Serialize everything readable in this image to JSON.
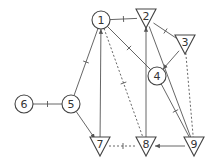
{
  "diagram": {
    "nodes": [
      {
        "id": "1",
        "label": "1",
        "shape": "circle",
        "x": 101,
        "y": 20
      },
      {
        "id": "2",
        "label": "2",
        "shape": "triangle",
        "x": 146,
        "y": 18
      },
      {
        "id": "3",
        "label": "3",
        "shape": "triangle",
        "x": 185,
        "y": 44
      },
      {
        "id": "4",
        "label": "4",
        "shape": "circle",
        "x": 157,
        "y": 76
      },
      {
        "id": "5",
        "label": "5",
        "shape": "circle",
        "x": 71,
        "y": 104
      },
      {
        "id": "6",
        "label": "6",
        "shape": "circle",
        "x": 24,
        "y": 104
      },
      {
        "id": "7",
        "label": "7",
        "shape": "triangle",
        "x": 100,
        "y": 146
      },
      {
        "id": "8",
        "label": "8",
        "shape": "triangle",
        "x": 146,
        "y": 146
      },
      {
        "id": "9",
        "label": "9",
        "shape": "triangle",
        "x": 194,
        "y": 146
      }
    ],
    "edges": [
      {
        "from": "6",
        "to": "5",
        "style": "solid",
        "tick": true,
        "arrow": false
      },
      {
        "from": "5",
        "to": "1",
        "style": "solid",
        "tick": true,
        "arrow": false
      },
      {
        "from": "1",
        "to": "2",
        "style": "solid",
        "tick": true,
        "arrow": false
      },
      {
        "from": "1",
        "to": "4",
        "style": "solid",
        "tick": true,
        "arrow": false
      },
      {
        "from": "2",
        "to": "3",
        "style": "solid",
        "tick": true,
        "arrow": false
      },
      {
        "from": "3",
        "to": "4",
        "style": "solid",
        "tick": false,
        "arrow": true
      },
      {
        "from": "7",
        "to": "1",
        "style": "solid",
        "tick": false,
        "arrow": true
      },
      {
        "from": "5",
        "to": "7",
        "style": "solid",
        "tick": false,
        "arrow": true
      },
      {
        "from": "1",
        "to": "8",
        "style": "dotted",
        "tick": true,
        "arrow": false
      },
      {
        "from": "8",
        "to": "2",
        "style": "solid",
        "tick": false,
        "arrow": true
      },
      {
        "from": "2",
        "to": "9",
        "style": "solid",
        "tick": false,
        "arrow": false
      },
      {
        "from": "4",
        "to": "9",
        "style": "solid",
        "tick": true,
        "arrow": false
      },
      {
        "from": "3",
        "to": "9",
        "style": "dotted",
        "tick": false,
        "arrow": false
      },
      {
        "from": "9",
        "to": "8",
        "style": "solid",
        "tick": false,
        "arrow": true
      },
      {
        "from": "7",
        "to": "8",
        "style": "dotted",
        "tick": true,
        "arrow": false
      }
    ]
  }
}
